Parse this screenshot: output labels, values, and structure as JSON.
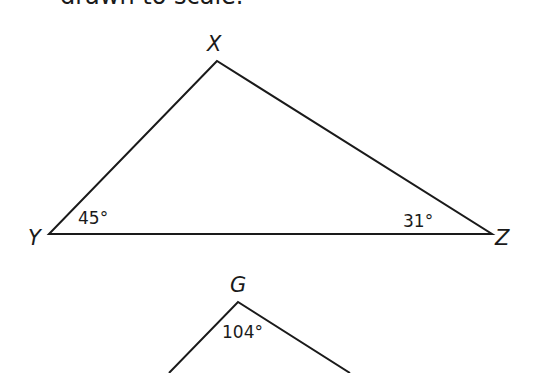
{
  "caption": "drawn to scale.",
  "triangle_xyz": {
    "vertices": {
      "X": "X",
      "Y": "Y",
      "Z": "Z"
    },
    "angles": {
      "Y": "45°",
      "Z": "31°"
    }
  },
  "triangle_g": {
    "vertices": {
      "G": "G"
    },
    "angles": {
      "G": "104°"
    }
  }
}
